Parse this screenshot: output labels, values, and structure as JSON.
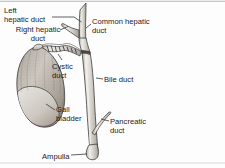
{
  "figure": {
    "background_color": "#fdfdfd",
    "frame_line_color": "#b9b9b9",
    "ink_color": "#1a1a1a",
    "duct_fill_color": "#cfcbc6",
    "duct_highlight_color": "#efedea",
    "gallbladder_fill_color": "#c7c2bb",
    "gallbladder_shade_color": "#8e8880",
    "leader_line_color": "#4a4a4a"
  },
  "labels": {
    "left_hepatic_duct": "Left\nhepatic duct",
    "right_hepatic_duct": "Right hepatic\nduct",
    "common_hepatic_duct": "Common hepatic\nduct",
    "cystic_duct": "Cystic\nduct",
    "bile_duct": "Bile duct",
    "gall_bladder": "Gall\nbladder",
    "pancreatic_duct": "Pancreatic\nduct",
    "ampulla": "Ampulla"
  },
  "structures": [
    {
      "name": "left-hepatic-duct",
      "label": "Left hepatic duct"
    },
    {
      "name": "right-hepatic-duct",
      "label": "Right hepatic duct"
    },
    {
      "name": "common-hepatic-duct",
      "label": "Common hepatic duct"
    },
    {
      "name": "cystic-duct",
      "label": "Cystic duct"
    },
    {
      "name": "bile-duct",
      "label": "Bile duct"
    },
    {
      "name": "gall-bladder",
      "label": "Gall bladder"
    },
    {
      "name": "pancreatic-duct",
      "label": "Pancreatic duct"
    },
    {
      "name": "ampulla",
      "label": "Ampulla"
    }
  ]
}
